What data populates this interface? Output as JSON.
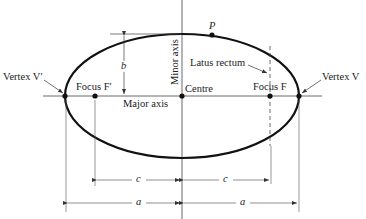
{
  "diagram": {
    "colors": {
      "curve": "#111111",
      "lines": "#333333",
      "text": "#222222",
      "background": "#ffffff"
    },
    "geometry": {
      "centre": [
        182,
        96
      ],
      "semi_major_px": 117,
      "semi_minor_px": 62,
      "focus_left_x": 95,
      "focus_right_x": 270,
      "point_p": [
        212,
        35
      ]
    },
    "labels": {
      "vertex_left": "Vertex V′",
      "vertex_right": "Vertex V",
      "focus_left": "Focus F′",
      "focus_right": "Focus F",
      "centre": "Centre",
      "major_axis": "Major axis",
      "minor_axis": "Minor axis",
      "latus_rectum": "Latus rectum",
      "point_p": "P",
      "semi_minor": "b",
      "focal_distance_left": "c",
      "focal_distance_right": "c",
      "semi_major_left": "a",
      "semi_major_right": "a"
    }
  }
}
